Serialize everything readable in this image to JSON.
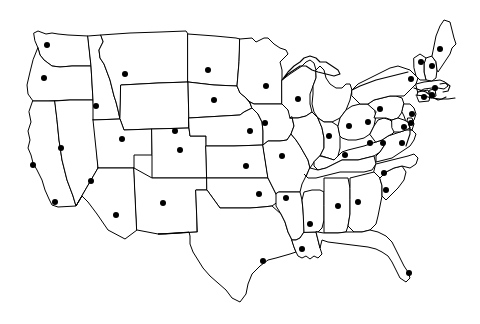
{
  "map": {
    "title": "United States Outline Map with City Markers",
    "region": "Contiguous United States",
    "projection": "simple-planar",
    "background_color": "#ffffff",
    "border_color": "#000000",
    "marker_color": "#000000",
    "marker_radius_px": 3,
    "width_px": 480,
    "height_px": 324,
    "artifact_text": "",
    "legend_visible": false,
    "labels_visible": false,
    "marker_count": 48,
    "state_count": 49
  },
  "chart_data": {
    "type": "scatter",
    "xlabel": "",
    "ylabel": "",
    "xlim": [
      0,
      480
    ],
    "ylim": [
      0,
      324
    ],
    "grid": false,
    "legend_position": "none",
    "points": [
      {
        "name": "Seattle",
        "state": "WA",
        "x": 47,
        "y": 45
      },
      {
        "name": "Salem",
        "state": "OR",
        "x": 44,
        "y": 78
      },
      {
        "name": "Boise",
        "state": "ID",
        "x": 96,
        "y": 106
      },
      {
        "name": "Helena",
        "state": "MT",
        "x": 125,
        "y": 74
      },
      {
        "name": "Cheyenne",
        "state": "WY",
        "x": 175,
        "y": 131
      },
      {
        "name": "Salt Lake City",
        "state": "UT",
        "x": 122,
        "y": 139
      },
      {
        "name": "Reno",
        "state": "NV",
        "x": 61,
        "y": 148
      },
      {
        "name": "San Francisco",
        "state": "CA",
        "x": 33,
        "y": 165
      },
      {
        "name": "Los Angeles",
        "state": "CA",
        "x": 55,
        "y": 202
      },
      {
        "name": "Phoenix",
        "state": "AZ",
        "x": 116,
        "y": 215
      },
      {
        "name": "Las Vegas",
        "state": "NV",
        "x": 91,
        "y": 181
      },
      {
        "name": "Santa Fe",
        "state": "NM",
        "x": 163,
        "y": 203
      },
      {
        "name": "Denver",
        "state": "CO",
        "x": 180,
        "y": 150
      },
      {
        "name": "Bismarck",
        "state": "ND",
        "x": 208,
        "y": 70
      },
      {
        "name": "Pierre",
        "state": "SD",
        "x": 214,
        "y": 100
      },
      {
        "name": "Lincoln",
        "state": "NE",
        "x": 250,
        "y": 131
      },
      {
        "name": "Topeka",
        "state": "KS",
        "x": 246,
        "y": 166
      },
      {
        "name": "Oklahoma City",
        "state": "OK",
        "x": 259,
        "y": 194
      },
      {
        "name": "Austin",
        "state": "TX",
        "x": 263,
        "y": 261
      },
      {
        "name": "Minneapolis",
        "state": "MN",
        "x": 266,
        "y": 86
      },
      {
        "name": "Des Moines",
        "state": "IA",
        "x": 265,
        "y": 123
      },
      {
        "name": "Kansas City",
        "state": "MO",
        "x": 282,
        "y": 156
      },
      {
        "name": "Little Rock",
        "state": "AR",
        "x": 286,
        "y": 198
      },
      {
        "name": "Baton Rouge",
        "state": "LA",
        "x": 302,
        "y": 249
      },
      {
        "name": "Jackson",
        "state": "MS",
        "x": 310,
        "y": 224
      },
      {
        "name": "Madison",
        "state": "WI",
        "x": 298,
        "y": 99
      },
      {
        "name": "Springfield",
        "state": "IL",
        "x": 329,
        "y": 136
      },
      {
        "name": "Indianapolis",
        "state": "IN",
        "x": 349,
        "y": 126
      },
      {
        "name": "Nashville",
        "state": "TN",
        "x": 345,
        "y": 155
      },
      {
        "name": "Montgomery",
        "state": "AL",
        "x": 338,
        "y": 206
      },
      {
        "name": "Atlanta",
        "state": "GA",
        "x": 358,
        "y": 202
      },
      {
        "name": "Frankfort",
        "state": "KY",
        "x": 370,
        "y": 143
      },
      {
        "name": "Columbus",
        "state": "OH",
        "x": 368,
        "y": 122
      },
      {
        "name": "Columbia",
        "state": "SC",
        "x": 386,
        "y": 190
      },
      {
        "name": "Raleigh",
        "state": "NC",
        "x": 384,
        "y": 173
      },
      {
        "name": "Charleston",
        "state": "WV",
        "x": 383,
        "y": 143
      },
      {
        "name": "Richmond",
        "state": "VA",
        "x": 402,
        "y": 143
      },
      {
        "name": "Miami",
        "state": "FL",
        "x": 409,
        "y": 273
      },
      {
        "name": "Harrisburg",
        "state": "PA",
        "x": 380,
        "y": 109
      },
      {
        "name": "Albany",
        "state": "NY",
        "x": 411,
        "y": 79
      },
      {
        "name": "Baltimore",
        "state": "MD",
        "x": 404,
        "y": 127
      },
      {
        "name": "Dover",
        "state": "DE",
        "x": 411,
        "y": 123
      },
      {
        "name": "Trenton",
        "state": "NJ",
        "x": 412,
        "y": 114
      },
      {
        "name": "Hartford",
        "state": "CT",
        "x": 424,
        "y": 97
      },
      {
        "name": "Providence",
        "state": "RI",
        "x": 432,
        "y": 95
      },
      {
        "name": "Boston",
        "state": "MA",
        "x": 435,
        "y": 88
      },
      {
        "name": "Concord",
        "state": "NH",
        "x": 432,
        "y": 66
      },
      {
        "name": "Montpelier",
        "state": "VT",
        "x": 421,
        "y": 62
      },
      {
        "name": "Augusta",
        "state": "ME",
        "x": 440,
        "y": 49
      }
    ]
  }
}
